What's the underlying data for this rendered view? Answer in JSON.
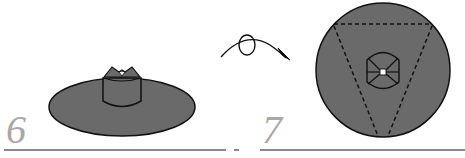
{
  "diagram": {
    "type": "origami-instructions",
    "steps": [
      {
        "number": "6",
        "description": "side view: flat disc with cylindrical center and pointed top"
      },
      {
        "number": "7",
        "description": "top view: circle with dashed inverted triangle fold lines and centered barrel shape"
      }
    ],
    "transition": {
      "symbol": "turn-over-arrow",
      "description": "curved arrow with loop indicating flip over"
    },
    "colors": {
      "fill": "#6a6a6a",
      "stroke": "#111111",
      "step_number": "#a8a8a8",
      "rule": "#8a8a8a",
      "background": "#ffffff"
    }
  }
}
